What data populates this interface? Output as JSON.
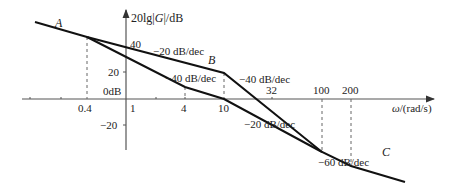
{
  "diagram": {
    "type": "bode-magnitude-asymptotic",
    "y_axis_label": {
      "prefix": "20lg|",
      "var": "G",
      "suffix": "|/dB"
    },
    "x_axis_label": {
      "var": "ω",
      "suffix": "/(rad/s)"
    },
    "y_ticks": [
      {
        "value": 40,
        "label": "40"
      },
      {
        "value": 20,
        "label": "20"
      },
      {
        "value": 0,
        "label": "0dB"
      },
      {
        "value": -20,
        "label": "−20"
      }
    ],
    "x_ticks": [
      {
        "value": 0.4,
        "label": "0.4"
      },
      {
        "value": 1,
        "label": "1"
      },
      {
        "value": 4,
        "label": "4"
      },
      {
        "value": 10,
        "label": "10"
      },
      {
        "value": 32,
        "label": "32"
      },
      {
        "value": 100,
        "label": "100"
      },
      {
        "value": 200,
        "label": "200"
      }
    ],
    "points": {
      "A": "A",
      "B": "B",
      "C": "C"
    },
    "slope_labels": {
      "upper_first": "−20 dB/dec",
      "lower_first": "−40 dB/dec",
      "upper_second": "−40 dB/dec",
      "lower_second": "−20 dB/dec",
      "final": "−60 dB/dec"
    },
    "curves": [
      {
        "name": "upper",
        "breakpoints": [
          [
            0.4,
            48
          ],
          [
            10,
            20
          ],
          [
            100,
            -20
          ],
          [
            200,
            -32
          ]
        ],
        "slopes": [
          "-20 dB/dec",
          "-40 dB/dec",
          "-40 dB/dec",
          "-60 dB/dec"
        ]
      },
      {
        "name": "lower",
        "breakpoints": [
          [
            0.4,
            48
          ],
          [
            4,
            8
          ],
          [
            10,
            0
          ],
          [
            100,
            -20
          ]
        ],
        "slopes": [
          "-40 dB/dec",
          "-20 dB/dec",
          "-20 dB/dec"
        ]
      }
    ]
  }
}
